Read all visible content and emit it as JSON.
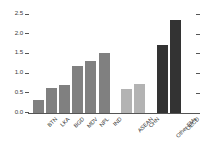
{
  "chart_data": {
    "type": "bar",
    "title": "",
    "subtitle": "",
    "xlabel": "",
    "ylabel": "",
    "ylim": [
      0.0,
      2.5
    ],
    "grid": false,
    "legend": "none",
    "ytick_labels": [
      "0.0",
      "0.5",
      "1.0",
      "1.5",
      "2.0",
      "2.5"
    ],
    "ytick_values": [
      0.0,
      0.5,
      1.0,
      1.5,
      2.0,
      2.5
    ],
    "categories": [
      "BTN",
      "LKA",
      "BGD",
      "MDV",
      "NPL",
      "IND",
      "ASEAN",
      "CHN",
      "Other EMs",
      "OECD"
    ],
    "values": [
      0.32,
      0.64,
      0.7,
      1.2,
      1.32,
      1.52,
      0.62,
      0.74,
      1.73,
      2.35
    ],
    "bars": [
      {
        "label": "BTN",
        "value": 0.32,
        "group": "south-asia",
        "color": "#808080"
      },
      {
        "label": "LKA",
        "value": 0.64,
        "group": "south-asia",
        "color": "#808080"
      },
      {
        "label": "BGD",
        "value": 0.7,
        "group": "south-asia",
        "color": "#808080"
      },
      {
        "label": "MDV",
        "value": 1.2,
        "group": "south-asia",
        "color": "#808080"
      },
      {
        "label": "NPL",
        "value": 1.32,
        "group": "south-asia",
        "color": "#808080"
      },
      {
        "label": "IND",
        "value": 1.52,
        "group": "south-asia",
        "color": "#808080"
      },
      {
        "label": "ASEAN",
        "value": 0.62,
        "group": "comparator",
        "color": "#b3b3b3"
      },
      {
        "label": "CHN",
        "value": 0.74,
        "group": "comparator",
        "color": "#b3b3b3"
      },
      {
        "label": "Other EMs",
        "value": 1.73,
        "group": "benchmark",
        "color": "#333333"
      },
      {
        "label": "OECD",
        "value": 2.35,
        "group": "benchmark",
        "color": "#333333"
      }
    ],
    "group_colors": {
      "south-asia": "#808080",
      "comparator": "#b3b3b3",
      "benchmark": "#333333"
    },
    "axis_color": "#555555"
  }
}
